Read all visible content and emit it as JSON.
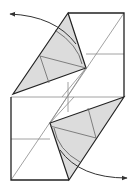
{
  "diagram": {
    "colors": {
      "background": "#ffffff",
      "edge": "#222222",
      "crease": "#888888",
      "flap_fill": "#dcdcdc",
      "arrow": "#333333"
    },
    "elements": [
      {
        "type": "square-outline",
        "label": "rectangle sheet"
      },
      {
        "type": "flap",
        "label": "upper-left shaded flap"
      },
      {
        "type": "flap",
        "label": "lower-right shaded flap"
      },
      {
        "type": "arrow",
        "label": "swing upper flap left"
      },
      {
        "type": "arrow",
        "label": "swing lower flap right"
      }
    ]
  }
}
